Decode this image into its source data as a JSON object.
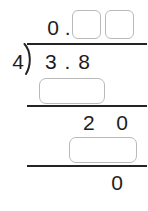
{
  "problem": {
    "type": "long-division",
    "divisor": "4",
    "dividend": "3 . 8",
    "dividend_value": "3.8",
    "quotient_prefix": "0 .",
    "bring_down_row": "2   0",
    "final_remainder": "0"
  },
  "quotient": {
    "prefix_label": "0 .",
    "boxes": [
      {
        "value": "",
        "placeholder": ""
      },
      {
        "value": "",
        "placeholder": ""
      }
    ]
  },
  "work": {
    "subtract_box_1": {
      "value": "",
      "placeholder": ""
    },
    "bring_down": "2   0",
    "subtract_box_2": {
      "value": "",
      "placeholder": ""
    },
    "remainder": "0"
  },
  "colors": {
    "ink": "#1c1c1c",
    "rule": "#242424",
    "box_border": "#b9b9b9",
    "background": "#ffffff"
  }
}
